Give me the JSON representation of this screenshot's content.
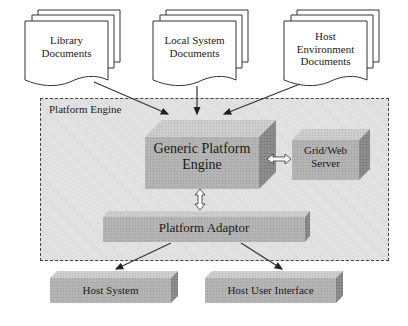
{
  "diagram": {
    "documents": [
      {
        "id": "library",
        "label_lines": [
          "Library",
          "Documents"
        ]
      },
      {
        "id": "local-system",
        "label_lines": [
          "Local System",
          "Documents"
        ]
      },
      {
        "id": "host-environment",
        "label_lines": [
          "Host",
          "Environment",
          "Documents"
        ]
      }
    ],
    "container": {
      "title": "Platform Engine"
    },
    "blocks": {
      "engine": {
        "label_lines": [
          "Generic Platform",
          "Engine"
        ]
      },
      "grid": {
        "label_lines": [
          "Grid/Web",
          "Server"
        ]
      },
      "adaptor": {
        "label": "Platform Adaptor"
      },
      "host_system": {
        "label": "Host System"
      },
      "host_ui": {
        "label": "Host User Interface"
      }
    },
    "connections": [
      {
        "from": "Library Documents",
        "to": "Generic Platform Engine",
        "type": "arrow"
      },
      {
        "from": "Local System Documents",
        "to": "Generic Platform Engine",
        "type": "arrow"
      },
      {
        "from": "Host Environment Documents",
        "to": "Generic Platform Engine",
        "type": "arrow"
      },
      {
        "from": "Generic Platform Engine",
        "to": "Grid/Web Server",
        "type": "bidirectional"
      },
      {
        "from": "Generic Platform Engine",
        "to": "Platform Adaptor",
        "type": "bidirectional"
      },
      {
        "from": "Platform Adaptor",
        "to": "Host System",
        "type": "arrow"
      },
      {
        "from": "Platform Adaptor",
        "to": "Host User Interface",
        "type": "arrow"
      }
    ],
    "colors": {
      "block_front": "#b4b4b4",
      "block_top": "#cfcfcf",
      "block_side": "#8a8a8a",
      "container_bg": "#e3e3e3",
      "line": "#333333"
    }
  }
}
